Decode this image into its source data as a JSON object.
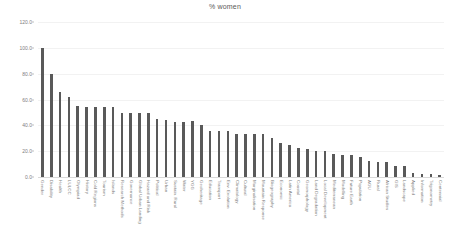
{
  "chart_data": {
    "type": "bar",
    "title": "% women",
    "xlabel": "",
    "ylabel": "",
    "ylim": [
      0,
      120
    ],
    "ytick_step": 20,
    "ytick_labels": [
      "0.0",
      "20.0",
      "40.0",
      "60.0",
      "80.0",
      "100.0",
      "120.0"
    ],
    "ytick_values": [
      0,
      20,
      40,
      60,
      80,
      100,
      120
    ],
    "grid": true,
    "legend": "none",
    "bar_color": "#595959",
    "gridline_color": "#f2f2f2",
    "axis_color": "#d9d9d9",
    "tick_label_color": "#808080",
    "title_color": "#595959",
    "xtick_rotation": 90,
    "categories": [
      "Gender",
      "Disability",
      "Health",
      "LULCC",
      "Olympiad",
      "History",
      "Cold Regions",
      "Tourism",
      "Islands",
      "Research Methods",
      "Governance",
      "Global Urban Landing",
      "Hazard and Risk",
      "Political",
      "Urban",
      "Sustain. Rural",
      "Water",
      "YGG",
      "Geoheritage",
      "Education",
      "Transport",
      "Env. Evolution",
      "Climatology",
      "Cultural",
      "Marginalisation",
      "Mountain Response",
      "Biogeography",
      "Economic",
      "Latin America",
      "Coastal",
      "Geomorphology",
      "Land Degradation",
      "Local Development",
      "Mediterranean",
      "Modelling",
      "Future Earth",
      "Population",
      "AGU",
      "Rural",
      "African Studies",
      "GIS",
      "Landscape",
      "Applied",
      "Information",
      "Trigonometry",
      "Centennial"
    ],
    "values": [
      99.5,
      79.5,
      66.0,
      62.0,
      55.0,
      54.0,
      54.0,
      54.0,
      54.0,
      49.5,
      49.5,
      49.5,
      49.5,
      45.0,
      44.5,
      42.5,
      42.5,
      43.0,
      40.0,
      36.0,
      35.5,
      36.0,
      33.5,
      33.5,
      33.5,
      33.5,
      30.5,
      26.5,
      25.0,
      22.5,
      22.0,
      20.0,
      20.0,
      18.0,
      17.0,
      17.0,
      15.5,
      12.5,
      12.0,
      12.0,
      8.5,
      8.5,
      3.0,
      2.5,
      2.0,
      1.5
    ]
  }
}
